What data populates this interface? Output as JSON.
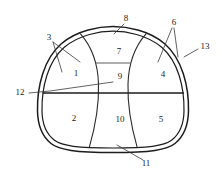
{
  "figure": {
    "kind": "tunnel-cross-section-diagram",
    "caption": "",
    "stroke_color": "#1c1c1c",
    "background_color": "#ffffff",
    "zone_label_color": "#1a1a1a"
  },
  "zones": [
    {
      "id": "zone-1",
      "label": "1",
      "x": 76,
      "y": 74,
      "position": "left-upper"
    },
    {
      "id": "zone-2",
      "label": "2",
      "x": 74,
      "y": 119,
      "position": "left-lower"
    },
    {
      "id": "zone-4",
      "label": "4",
      "x": 163,
      "y": 75,
      "position": "right-upper"
    },
    {
      "id": "zone-5",
      "label": "5",
      "x": 161,
      "y": 120,
      "position": "right-lower"
    },
    {
      "id": "zone-7",
      "label": "7",
      "x": 119,
      "y": 52,
      "position": "crown-center"
    },
    {
      "id": "zone-9",
      "label": "9",
      "x": 120,
      "y": 77,
      "position": "middle-center"
    },
    {
      "id": "zone-10",
      "label": "10",
      "x": 120,
      "y": 120,
      "position": "bottom-center"
    }
  ],
  "callouts": [
    {
      "id": "callout-3",
      "label": "3",
      "label_x": 49,
      "label_y": 38,
      "target_desc": "left inner curved divider at crown springing",
      "leaders": [
        [
          [
            53,
            42
          ],
          [
            80,
            62
          ]
        ],
        [
          [
            53,
            42
          ],
          [
            62,
            72
          ]
        ]
      ]
    },
    {
      "id": "callout-6",
      "label": "6",
      "label_x": 174,
      "label_y": 23,
      "target_desc": "right inner curved divider at crown springing",
      "leaders": [
        [
          [
            172,
            28
          ],
          [
            158,
            62
          ]
        ],
        [
          [
            174,
            28
          ],
          [
            178,
            57
          ]
        ]
      ]
    },
    {
      "id": "callout-8",
      "label": "8",
      "label_x": 126,
      "label_y": 19,
      "target_desc": "outer lining at tunnel crown",
      "leaders": [
        [
          [
            124,
            24
          ],
          [
            114,
            34
          ]
        ]
      ]
    },
    {
      "id": "callout-11",
      "label": "11",
      "label_x": 146,
      "label_y": 164,
      "target_desc": "invert lining at tunnel floor",
      "leaders": [
        [
          [
            143,
            160
          ],
          [
            117,
            145
          ]
        ]
      ]
    },
    {
      "id": "callout-12",
      "label": "12",
      "label_x": 20,
      "label_y": 93,
      "target_desc": "mid-level bench horizontal divider",
      "leaders": [
        [
          [
            29,
            93
          ],
          [
            50,
            91
          ]
        ],
        [
          [
            50,
            91
          ],
          [
            113,
            82
          ]
        ]
      ]
    },
    {
      "id": "callout-13",
      "label": "13",
      "label_x": 205,
      "label_y": 47,
      "target_desc": "outer lining at tunnel sidewall",
      "leaders": [
        [
          [
            198,
            49
          ],
          [
            184,
            57
          ]
        ]
      ]
    }
  ],
  "geometry_notes": {
    "outer_shell_double_line": true,
    "horizontal_dividers": [
      63,
      93
    ],
    "curved_vertical_dividers": 2
  }
}
